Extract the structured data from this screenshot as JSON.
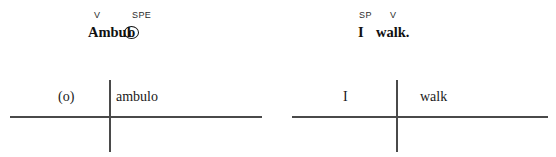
{
  "figure": {
    "panels": [
      {
        "id": "latin",
        "gloss": {
          "tags": [
            {
              "text": "V",
              "left": 94
            },
            {
              "text": "SPE",
              "left": 132
            }
          ],
          "word_segments": [
            {
              "text": "Ambul",
              "left": 0,
              "circled": false
            },
            {
              "text": "o",
              "left": 39,
              "circled": true
            }
          ],
          "word_full": "Ambulo"
        },
        "diagram": {
          "left_cell": "(o)",
          "right_cell": "ambulo"
        }
      },
      {
        "id": "english",
        "gloss": {
          "tags": [
            {
              "text": "SP",
              "left": 81
            },
            {
              "text": "V",
              "left": 112
            }
          ],
          "word_segments": [
            {
              "text": "I",
              "left": 0,
              "circled": false
            },
            {
              "text": "walk.",
              "left": 18,
              "circled": false
            }
          ],
          "word_full": "I walk."
        },
        "diagram": {
          "left_cell": "I",
          "right_cell": "walk"
        }
      }
    ],
    "colors": {
      "text": "#1a1a1a",
      "rule": "#4a4a4a",
      "tag": "#2b2b2b"
    }
  }
}
